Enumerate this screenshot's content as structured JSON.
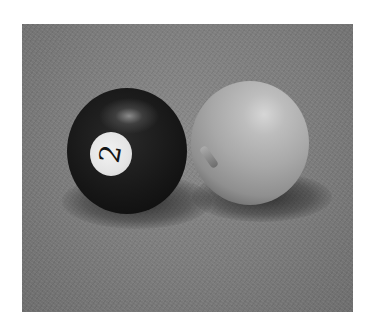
{
  "image": {
    "description": "Black-and-white photograph of two billiard balls on a felt table: a dark 2-ball on the left and a plain cue ball on the right",
    "objects": [
      {
        "name": "two-ball",
        "label": "2",
        "color": "#141414"
      },
      {
        "name": "cue-ball",
        "color": "#b0b0b0"
      }
    ],
    "background_color": "#7f7f7f"
  }
}
